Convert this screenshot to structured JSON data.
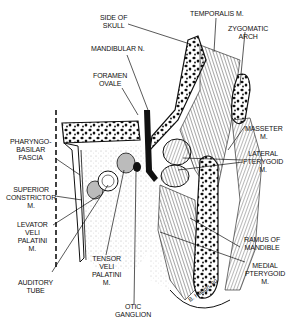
{
  "figure": {
    "signature": "B. Haugh '80",
    "labels": {
      "side_of_skull": "SIDE OF\nSKULL",
      "temporalis": "TEMPORALIS M.",
      "zygomatic_arch": "ZYGOMATIC\nARCH",
      "mandibular_n": "MANDIBULAR N.",
      "foramen_ovale": "FORAMEN\nOVALE",
      "masseter": "MASSETER\nM.",
      "lateral_pterygoid": "LATERAL\nPTERYGOID\nM.",
      "pharyngobasilar_fascia": "PHARYNGO-\nBASILAR\nFASCIA",
      "superior_constrictor": "SUPERIOR\nCONSTRICTOR\nM.",
      "levator_veli_palatini": "LEVATOR\nVELI\nPALATINI\nM.",
      "tensor_veli_palatini": "TENSOR\nVELI\nPALATINI\nM.",
      "auditory_tube": "AUDITORY\nTUBE",
      "otic_ganglion": "OTIC\nGANGLION",
      "ramus_of_mandible": "RAMUS OF\nMANDIBLE",
      "medial_pterygoid": "MEDIAL\nPTERYGOID\nM."
    },
    "colors": {
      "ink": "#111111",
      "paper": "#ffffff",
      "stipple": "#cfcfcf"
    }
  }
}
